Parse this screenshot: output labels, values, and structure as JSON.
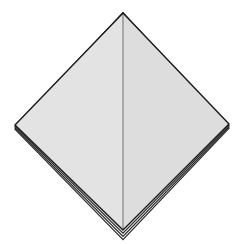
{
  "canvas": {
    "width": 248,
    "height": 244,
    "background_color": "#ffffff",
    "title": "Folded paper diamond shape"
  },
  "figure": {
    "name": "diamond-octahedron",
    "vertices": {
      "top": {
        "x": 123,
        "y": 13
      },
      "left": {
        "x": 15,
        "y": 125
      },
      "right": {
        "x": 229,
        "y": 124
      },
      "bottom": {
        "x": 123,
        "y": 230
      }
    },
    "ridge": {
      "x1": 123,
      "y1": 13,
      "x2": 123,
      "y2": 230,
      "color": "#9a9a9a",
      "width": 1.6
    },
    "faces": [
      {
        "name": "left-face",
        "points": "123,13 15,125 123,230",
        "fill": "#e3e3e3"
      },
      {
        "name": "right-face",
        "points": "123,13 229,124 123,230",
        "fill": "#dddddd"
      }
    ],
    "outline": {
      "color": "#1a1a1a",
      "width": 1.4
    },
    "layers": {
      "count": 4,
      "offsets": [
        0,
        3.2,
        6.4,
        9.6
      ],
      "color": "#2b2b2b",
      "width": 1.2,
      "fill": "#f2f2f2"
    }
  }
}
